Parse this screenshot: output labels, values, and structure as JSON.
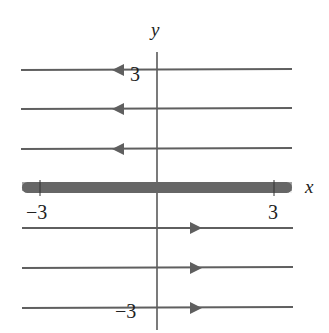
{
  "diagram": {
    "type": "phase_portrait",
    "axes": {
      "x_label": "x",
      "y_label": "y",
      "x_ticks": [
        {
          "value": -3,
          "label": "−3"
        },
        {
          "value": 3,
          "label": "3"
        }
      ],
      "y_ticks": [
        {
          "value": 3,
          "label": "3"
        },
        {
          "value": -3,
          "label": "−3"
        }
      ]
    },
    "equilibrium_line": {
      "description": "x-axis filled with fixed points",
      "y": 0
    },
    "flow_lines": [
      {
        "y": 3,
        "direction": "left"
      },
      {
        "y": 2,
        "direction": "left"
      },
      {
        "y": 1,
        "direction": "left"
      },
      {
        "y": -1,
        "direction": "right"
      },
      {
        "y": -2,
        "direction": "right"
      },
      {
        "y": -3,
        "direction": "right"
      }
    ],
    "colors": {
      "line": "#5f5f5f",
      "axis": "#333333",
      "dots": "#666666"
    }
  }
}
